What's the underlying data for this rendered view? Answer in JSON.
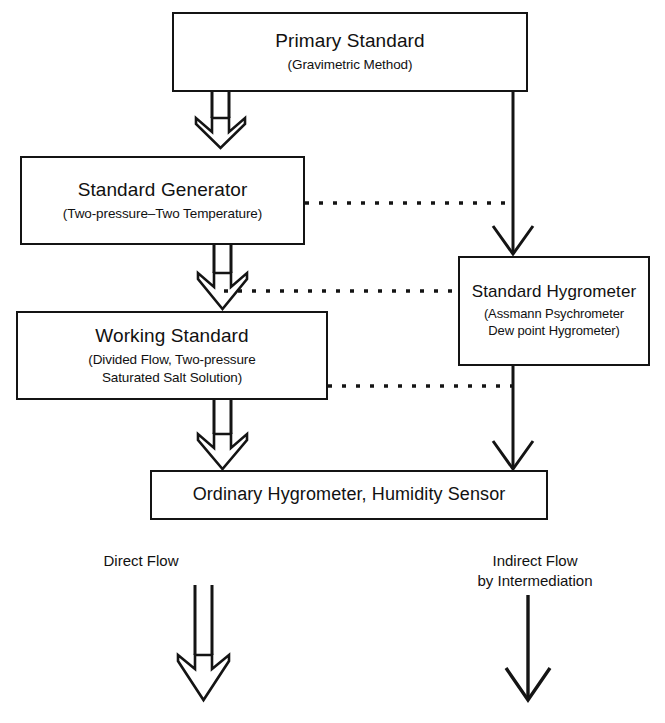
{
  "diagram": {
    "line_color": "#141414",
    "background": "#ffffff",
    "nodes": [
      {
        "id": "primary-standard",
        "title": "Primary Standard",
        "sub1": "(Gravimetric Method)",
        "sub2": ""
      },
      {
        "id": "standard-generator",
        "title": "Standard Generator",
        "sub1": "(Two-pressure–Two Temperature)",
        "sub2": ""
      },
      {
        "id": "working-standard",
        "title": "Working Standard",
        "sub1": "(Divided Flow, Two-pressure",
        "sub2": "Saturated Salt Solution)"
      },
      {
        "id": "standard-hygrometer",
        "title": "Standard Hygrometer",
        "sub1": "(Assmann Psychrometer",
        "sub2": "Dew point Hygrometer)"
      },
      {
        "id": "ordinary-hygrometer",
        "title": "Ordinary Hygrometer, Humidity Sensor",
        "sub1": "",
        "sub2": ""
      }
    ],
    "legend": {
      "direct": {
        "line1": "Direct Flow",
        "line2": "",
        "arrow_style": "double-line-open"
      },
      "indirect": {
        "line1": "Indirect Flow",
        "line2": "by Intermediation",
        "arrow_style": "single-line"
      }
    },
    "edges": [
      {
        "id": "primary-to-generator",
        "style": "double-arrow"
      },
      {
        "id": "primary-to-hygrometer",
        "style": "single-arrow"
      },
      {
        "id": "generator-to-working",
        "style": "double-arrow"
      },
      {
        "id": "working-to-ordinary",
        "style": "double-arrow"
      },
      {
        "id": "hygrometer-to-ordinary",
        "style": "single-arrow"
      },
      {
        "id": "generator-dash-hygrometer-line",
        "style": "dotted"
      },
      {
        "id": "hygrometer-dash-working-arrow",
        "style": "dotted"
      },
      {
        "id": "working-dash-hygrometer-line",
        "style": "dotted"
      }
    ]
  }
}
